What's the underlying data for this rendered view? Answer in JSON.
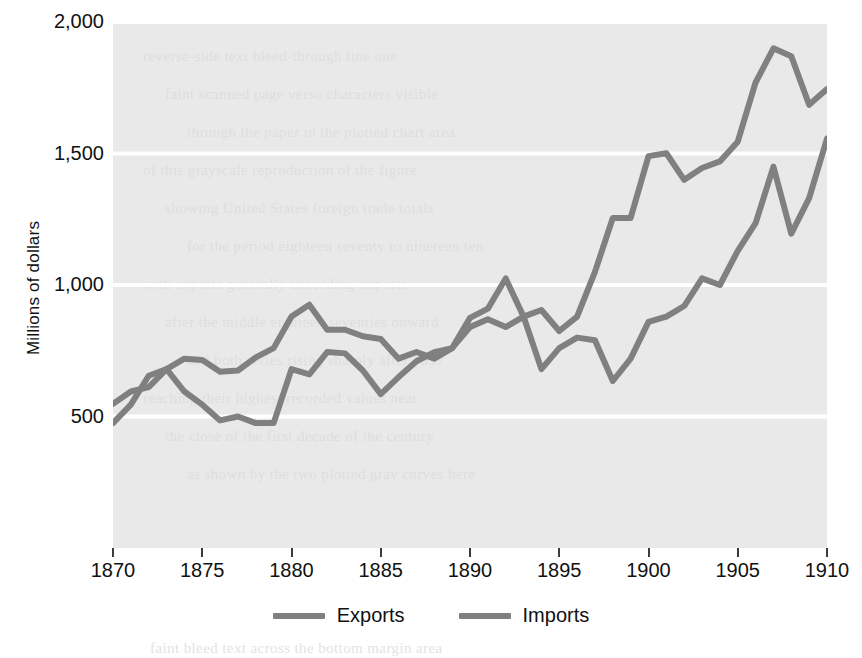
{
  "chart_data": {
    "type": "line",
    "title": "",
    "subtitle": "",
    "xlabel": "",
    "ylabel": "Millions of dollars",
    "xlim": [
      1870,
      1910
    ],
    "ylim": [
      0,
      2000
    ],
    "x_ticks": [
      1870,
      1875,
      1880,
      1885,
      1890,
      1895,
      1900,
      1905,
      1910
    ],
    "x_tick_labels": [
      "1870",
      "1875",
      "1880",
      "1885",
      "1890",
      "1895",
      "1900",
      "1905",
      "1910"
    ],
    "y_ticks": [
      500,
      1000,
      1500,
      2000
    ],
    "y_tick_labels": [
      "500",
      "1,000",
      "1,500",
      "2,000"
    ],
    "grid": "horizontal-white",
    "legend_position": "bottom-center",
    "plot_background": "#e9e9e9",
    "line_color": "#808080",
    "x": [
      1870,
      1871,
      1872,
      1873,
      1874,
      1875,
      1876,
      1877,
      1878,
      1879,
      1880,
      1881,
      1882,
      1883,
      1884,
      1885,
      1886,
      1887,
      1888,
      1889,
      1890,
      1891,
      1892,
      1893,
      1894,
      1895,
      1896,
      1897,
      1898,
      1899,
      1900,
      1901,
      1902,
      1903,
      1904,
      1905,
      1906,
      1907,
      1908,
      1909,
      1910
    ],
    "series": [
      {
        "name": "Exports",
        "color": "#808080",
        "values": [
          548,
          595,
          612,
          680,
          720,
          715,
          670,
          675,
          725,
          760,
          880,
          925,
          830,
          830,
          805,
          795,
          720,
          745,
          720,
          760,
          875,
          910,
          1025,
          880,
          905,
          825,
          880,
          1050,
          1255,
          1255,
          1490,
          1501,
          1400,
          1445,
          1470,
          1545,
          1770,
          1900,
          1870,
          1685,
          1745
        ]
      },
      {
        "name": "Imports",
        "color": "#808080",
        "values": [
          475,
          545,
          655,
          680,
          595,
          545,
          485,
          500,
          475,
          475,
          680,
          660,
          745,
          740,
          675,
          585,
          650,
          710,
          745,
          760,
          840,
          870,
          840,
          880,
          680,
          760,
          800,
          790,
          635,
          720,
          860,
          880,
          920,
          1025,
          1000,
          1130,
          1235,
          1450,
          1195,
          1330,
          1557
        ]
      }
    ]
  },
  "axes": {
    "y_title": "Millions of dollars"
  },
  "legend": {
    "items": [
      {
        "label": "Exports",
        "swatch_color": "#808080"
      },
      {
        "label": "Imports",
        "swatch_color": "#808080"
      }
    ]
  },
  "page_bleed": {
    "lines": [
      "reverse-side text bleed-through line one",
      "faint scanned page verso characters visible",
      "through the paper in the plotted chart area",
      "of this grayscale reproduction of the figure",
      "showing United States foreign trade totals",
      "for the period eighteen seventy to nineteen ten",
      "with exports generally exceeding imports",
      "after the middle eighteen seventies onward",
      "and both series rising sharply after 1897",
      "reaching their highest recorded values near",
      "the close of the first decade of the century",
      "as shown by the two plotted gray curves here"
    ],
    "bottom_line": "faint bleed text across the bottom margin area"
  }
}
